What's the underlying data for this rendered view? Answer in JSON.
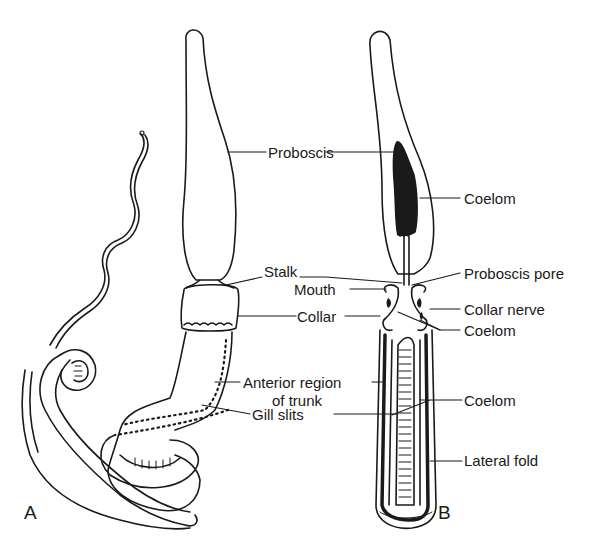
{
  "diagram": {
    "panels": [
      {
        "id": "A",
        "label": "A",
        "view": "external"
      },
      {
        "id": "B",
        "label": "B",
        "view": "longitudinal section"
      }
    ],
    "labels": {
      "proboscis": "Proboscis",
      "stalk": "Stalk",
      "mouth": "Mouth",
      "collar": "Collar",
      "anterior_region_line1": "Anterior region",
      "anterior_region_line2": "of trunk",
      "gill_slits": "Gill slits",
      "coelom_proboscis": "Coelom",
      "proboscis_pore": "Proboscis pore",
      "collar_nerve": "Collar nerve",
      "coelom_collar": "Coelom",
      "coelom_trunk": "Coelom",
      "lateral_fold": "Lateral fold"
    },
    "colors": {
      "ink": "#1a1a1a",
      "background": "#ffffff"
    }
  }
}
